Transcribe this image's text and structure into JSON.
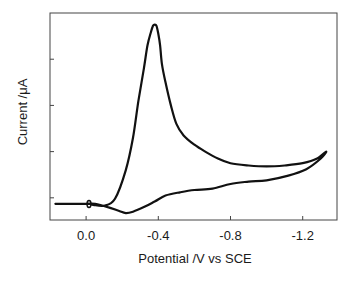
{
  "chart_data": {
    "type": "line",
    "title": "",
    "xlabel": "Potential /V vs SCE",
    "ylabel": "Current  /μA",
    "xlim": [
      0.2,
      -1.39
    ],
    "ylim": [
      -0.48,
      4.0
    ],
    "x_ticks": [
      0.0,
      -0.4,
      -0.8,
      -1.2
    ],
    "x_tick_labels": [
      "0.0",
      "-0.4",
      "-0.8",
      "-1.2"
    ],
    "y_ticks": [
      0,
      1,
      2,
      3
    ],
    "y_tick_labels": [
      "",
      "",
      "",
      ""
    ],
    "grid": false,
    "legend": null,
    "series": [
      {
        "name": "cyclic voltammogram",
        "x": [
          0.17,
          0.0,
          -0.02,
          -0.04,
          -0.1,
          -0.16,
          -0.22,
          -0.26,
          -0.29,
          -0.32,
          -0.34,
          -0.36,
          -0.37,
          -0.38,
          -0.39,
          -0.4,
          -0.41,
          -0.42,
          -0.44,
          -0.47,
          -0.5,
          -0.54,
          -0.6,
          -0.66,
          -0.73,
          -0.8,
          -0.9,
          -1.0,
          -1.1,
          -1.2,
          -1.28,
          -1.33,
          -1.3,
          -1.22,
          -1.12,
          -1.0,
          -0.9,
          -0.8,
          -0.7,
          -0.6,
          -0.52,
          -0.44,
          -0.38,
          -0.32,
          -0.26,
          -0.22,
          -0.18,
          -0.12,
          -0.05,
          0.0,
          0.02
        ],
        "y": [
          -0.13,
          -0.13,
          -0.13,
          -0.15,
          -0.17,
          -0.02,
          0.6,
          1.3,
          2.1,
          2.8,
          3.3,
          3.6,
          3.72,
          3.75,
          3.72,
          3.55,
          3.3,
          2.9,
          2.5,
          2.0,
          1.6,
          1.35,
          1.15,
          1.0,
          0.85,
          0.75,
          0.7,
          0.68,
          0.7,
          0.75,
          0.85,
          1.0,
          0.85,
          0.62,
          0.48,
          0.38,
          0.35,
          0.3,
          0.2,
          0.17,
          0.12,
          0.05,
          -0.08,
          -0.2,
          -0.3,
          -0.33,
          -0.28,
          -0.2,
          -0.13,
          -0.13,
          -0.13
        ]
      }
    ]
  }
}
